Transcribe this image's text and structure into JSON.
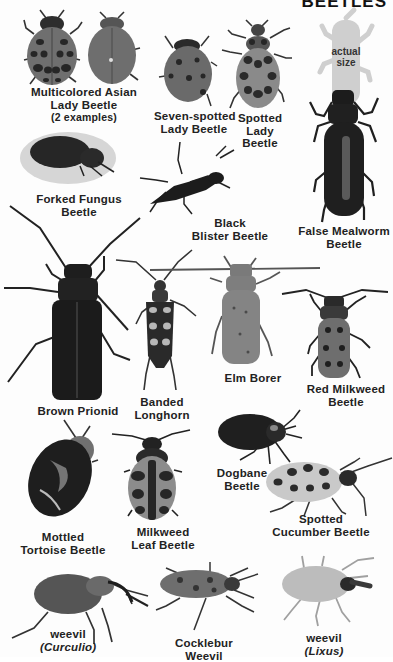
{
  "header": {
    "title": "BEETLES"
  },
  "actual_size": {
    "label_line1": "actual",
    "label_line2": "size"
  },
  "beetles": [
    {
      "id": "multicolored-asian-lady-beetle",
      "line1": "Multicolored Asian",
      "line2": "Lady Beetle",
      "line3": "(2 examples)"
    },
    {
      "id": "seven-spotted-lady-beetle",
      "line1": "Seven-spotted",
      "line2": "Lady Beetle"
    },
    {
      "id": "spotted-lady-beetle",
      "line1": "Spotted",
      "line2": "Lady",
      "line3": "Beetle"
    },
    {
      "id": "forked-fungus-beetle",
      "line1": "Forked Fungus",
      "line2": "Beetle"
    },
    {
      "id": "black-blister-beetle",
      "line1": "Black",
      "line2": "Blister Beetle"
    },
    {
      "id": "false-mealworm-beetle",
      "line1": "False Mealworm",
      "line2": "Beetle"
    },
    {
      "id": "brown-prionid",
      "line1": "Brown Prionid"
    },
    {
      "id": "banded-longhorn",
      "line1": "Banded",
      "line2": "Longhorn"
    },
    {
      "id": "elm-borer",
      "line1": "Elm Borer"
    },
    {
      "id": "red-milkweed-beetle",
      "line1": "Red Milkweed",
      "line2": "Beetle"
    },
    {
      "id": "dogbane-beetle",
      "line1": "Dogbane",
      "line2": "Beetle"
    },
    {
      "id": "mottled-tortoise-beetle",
      "line1": "Mottled",
      "line2": "Tortoise Beetle"
    },
    {
      "id": "milkweed-leaf-beetle",
      "line1": "Milkweed",
      "line2": "Leaf Beetle"
    },
    {
      "id": "spotted-cucumber-beetle",
      "line1": "Spotted",
      "line2": "Cucumber Beetle"
    },
    {
      "id": "weevil-curculio",
      "line1": "weevil",
      "line2": "(Curculio)"
    },
    {
      "id": "cocklebur-weevil",
      "line1": "Cocklebur",
      "line2": "Weevil"
    },
    {
      "id": "weevil-lixus",
      "line1": "weevil",
      "line2": "(Lixus)"
    }
  ],
  "colors": {
    "dark": "#2a2a2a",
    "mid": "#6e6e6e",
    "light": "#9a9a9a",
    "pale": "#c4c4c4",
    "ghost": "#cfcfcf"
  }
}
